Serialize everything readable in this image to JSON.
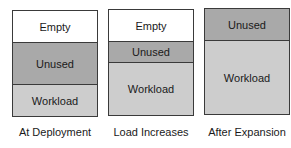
{
  "colors": {
    "empty": "#ffffff",
    "unused": "#a9a9a9",
    "workload": "#cdcdcd",
    "border": "#3a3a3a"
  },
  "stacks": [
    {
      "caption": "At Deployment",
      "segments": [
        {
          "label": "Empty",
          "type": "empty",
          "height": 32
        },
        {
          "label": "Unused",
          "type": "unused",
          "height": 42
        },
        {
          "label": "Workload",
          "type": "workload",
          "height": 32
        }
      ]
    },
    {
      "caption": "Load Increases",
      "segments": [
        {
          "label": "Empty",
          "type": "empty",
          "height": 32
        },
        {
          "label": "Unused",
          "type": "unused",
          "height": 21
        },
        {
          "label": "Workload",
          "type": "workload",
          "height": 53
        }
      ]
    },
    {
      "caption": "After Expansion",
      "segments": [
        {
          "label": "Unused",
          "type": "unused",
          "height": 32
        },
        {
          "label": "Workload",
          "type": "workload",
          "height": 74
        }
      ]
    }
  ]
}
